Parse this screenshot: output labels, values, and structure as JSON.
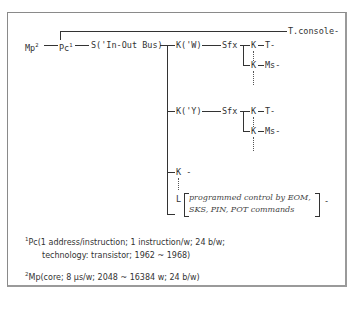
{
  "diagram": {
    "mp": {
      "label": "Mp",
      "sup": "2"
    },
    "pc": {
      "label": "Pc",
      "sup": "1"
    },
    "switch": "S('In-Out Bus)",
    "console": "T.console-",
    "kw": "K('W)",
    "ky": "K('Y)",
    "sfx1": "Sfx",
    "sfx2": "Sfx",
    "k": "K",
    "t_dash": "T-",
    "ms_dash": "Ms-",
    "k_dash": "K -",
    "l": "L",
    "l_note_line1": "programmed control by EOM,",
    "l_note_line2": "SKS, PIN, POT commands",
    "l_tail": "-"
  },
  "footnotes": {
    "fn1_sup": "1",
    "fn1_line1": "Pc(1 address/instruction; 1 instruction/w; 24 b/w;",
    "fn1_line2": "technology: transistor; 1962 ~ 1968)",
    "fn2_sup": "2",
    "fn2_line1": "Mp(core; 8 μs/w; 2048 ~ 16384 w; 24 b/w)"
  }
}
